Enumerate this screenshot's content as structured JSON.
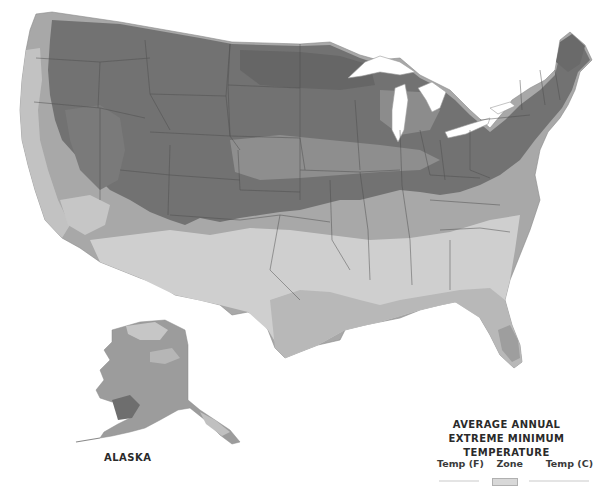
{
  "map": {
    "title": "Average Annual Extreme Minimum Temperature — USDA Plant Hardiness Zones (grayscale)",
    "inset_label": "ALASKA",
    "colors": {
      "zone_coldest": "#6b6b6b",
      "zone_cold": "#808080",
      "zone_mid": "#9a9a9a",
      "zone_mild": "#b4b4b4",
      "zone_warm": "#c8c8c8",
      "zone_warmest": "#d6d6d6",
      "state_border": "#4a4a4a",
      "water": "#ffffff"
    }
  },
  "legend": {
    "title_line1": "AVERAGE ANNUAL",
    "title_line2": "EXTREME MINIMUM TEMPERATURE",
    "columns": {
      "temp_f": "Temp (F)",
      "zone": "Zone",
      "temp_c": "Temp (C)"
    }
  }
}
